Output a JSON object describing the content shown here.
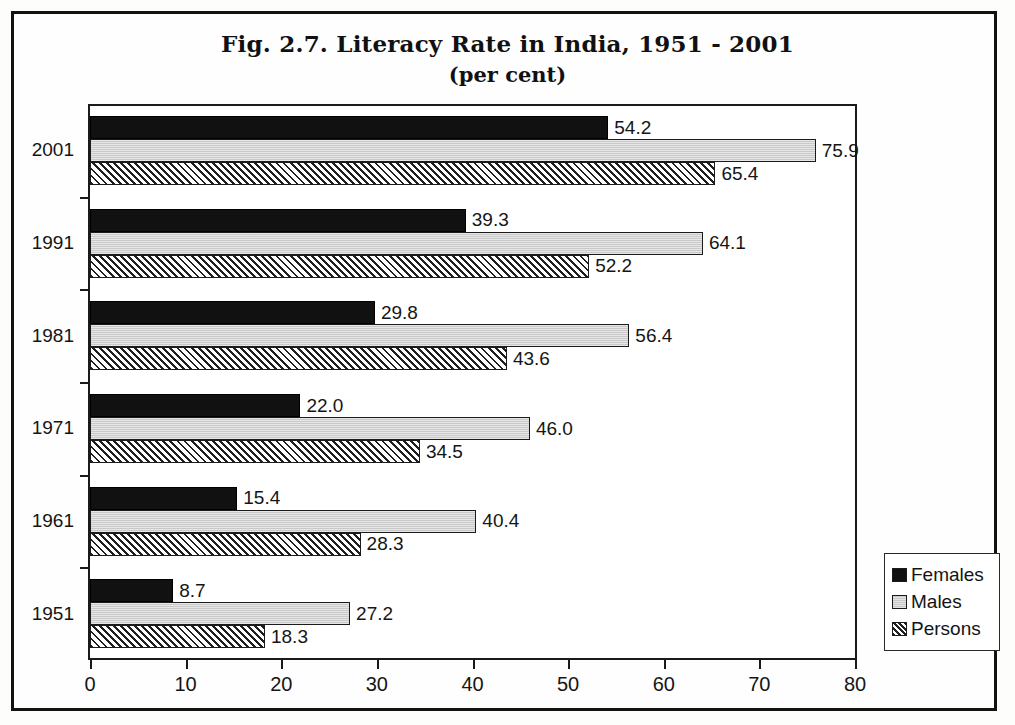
{
  "chart_data": {
    "type": "bar",
    "orientation": "horizontal",
    "title": "Fig. 2.7. Literacy Rate in India, 1951 - 2001",
    "subtitle": "(per cent)",
    "xlabel": "",
    "ylabel": "",
    "xlim": [
      0,
      80
    ],
    "xticks": [
      "0",
      "10",
      "20",
      "30",
      "40",
      "50",
      "60",
      "70",
      "80"
    ],
    "grid": false,
    "legend_position": "bottom-right-outside",
    "categories": [
      "2001",
      "1991",
      "1981",
      "1971",
      "1961",
      "1951"
    ],
    "series": [
      {
        "name": "Females",
        "style": "solid-black",
        "values": [
          54.2,
          39.3,
          29.8,
          22.0,
          15.4,
          8.7
        ],
        "labels": [
          "54.2",
          "39.3",
          "29.8",
          "22.0",
          "15.4",
          "8.7"
        ]
      },
      {
        "name": "Males",
        "style": "light-gray",
        "values": [
          75.9,
          64.1,
          56.4,
          46.0,
          40.4,
          27.2
        ],
        "labels": [
          "75.9",
          "64.1",
          "56.4",
          "46.0",
          "40.4",
          "27.2"
        ]
      },
      {
        "name": "Persons",
        "style": "diagonal-hatch",
        "values": [
          65.4,
          52.2,
          43.6,
          34.5,
          28.3,
          18.3
        ],
        "labels": [
          "65.4",
          "52.2",
          "43.6",
          "34.5",
          "28.3",
          "18.3"
        ]
      }
    ]
  },
  "legend": {
    "items": [
      {
        "label": "Females"
      },
      {
        "label": "Males"
      },
      {
        "label": "Persons"
      }
    ]
  },
  "colors": {
    "females": "#111111",
    "males": "#c9c9c9",
    "persons_hatch": "#1f1f1f",
    "axis": "#1a1a1a",
    "frame": "#121212",
    "background": "#fefefe"
  }
}
